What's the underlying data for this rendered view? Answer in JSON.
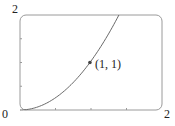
{
  "chart_data": {
    "type": "line",
    "title": "",
    "xlabel": "",
    "ylabel": "",
    "xlim": [
      0,
      2
    ],
    "ylim": [
      0,
      2
    ],
    "grid": false,
    "legend": null,
    "x_tick_labels": [
      "0",
      "2"
    ],
    "y_tick_labels": [
      "2"
    ],
    "x_minor_ticks": [
      0.5,
      1,
      1.5
    ],
    "y_minor_ticks": [
      0.5,
      1,
      1.5
    ],
    "series": [
      {
        "name": "y = x^2",
        "x": [
          0,
          0.25,
          0.5,
          0.75,
          1,
          1.25,
          1.414
        ],
        "y": [
          0,
          0.0625,
          0.25,
          0.5625,
          1,
          1.5625,
          2
        ]
      }
    ],
    "annotations": [
      {
        "x": 1,
        "y": 1,
        "text": "(1, 1)",
        "marker": "dot"
      }
    ]
  },
  "labels": {
    "origin": "0",
    "x_max": "2",
    "y_max": "2",
    "point": "(1, 1)"
  },
  "colors": {
    "frame": "#9a9a9a",
    "curve": "#6a6a6a",
    "point": "#444444"
  }
}
